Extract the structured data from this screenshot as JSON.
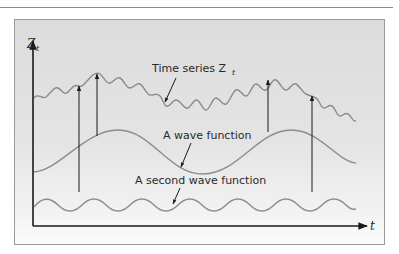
{
  "figure": {
    "y_axis_label": "Z",
    "y_axis_label_sub": "t",
    "x_axis_label": "t",
    "labels": {
      "time_series": "Time series Z",
      "time_series_sub": "t",
      "wave_function": "A wave function",
      "second_wave_function": "A second wave function"
    },
    "colors": {
      "curve": "#8c8c8c",
      "axis": "#1a1a1a",
      "arrow": "#1a1a1a",
      "panel": "#e2e2e2",
      "frame_border": "#9a9a9a"
    }
  }
}
